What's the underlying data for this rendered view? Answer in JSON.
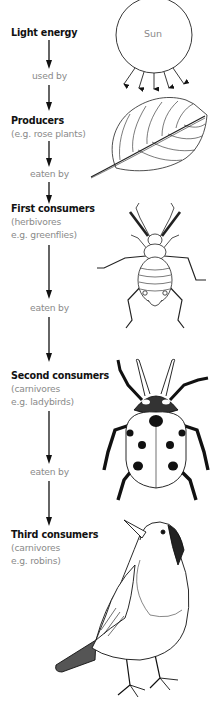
{
  "diagram": {
    "type": "food-chain",
    "stages": [
      {
        "title": "Light energy",
        "subtitle": [],
        "image": "sun-illustration",
        "image_label": "Sun"
      },
      {
        "title": "Producers",
        "subtitle": [
          "(e.g. rose plants)"
        ],
        "image": "leaf-illustration"
      },
      {
        "title": "First consumers",
        "subtitle": [
          "(herbivores",
          "e.g. greenflies)"
        ],
        "image": "greenfly-illustration"
      },
      {
        "title": "Second consumers",
        "subtitle": [
          "(carnivores",
          "e.g. ladybirds)"
        ],
        "image": "ladybird-illustration"
      },
      {
        "title": "Third consumers",
        "subtitle": [
          "(carnivores",
          "e.g. robins)"
        ],
        "image": "robin-illustration"
      }
    ],
    "links": [
      "used by",
      "eaten by",
      "eaten by",
      "eaten by"
    ],
    "colors": {
      "title_text": "#111111",
      "secondary_text": "#8a8a8a",
      "line": "#111111",
      "background": "#ffffff"
    }
  }
}
